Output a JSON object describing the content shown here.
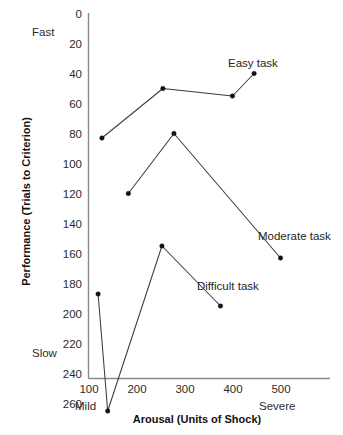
{
  "chart_data": {
    "type": "line",
    "title": "",
    "xlabel": "Arousal (Units of Shock)",
    "ylabel": "Performance (Trials to Criterion)",
    "xlim": [
      100,
      530
    ],
    "ylim": [
      0,
      275
    ],
    "y_inverted": true,
    "grid": false,
    "legend_position": "inline-end-labels",
    "x_ticks": [
      100,
      200,
      300,
      400,
      500
    ],
    "x_tick_labels": [
      "100",
      "200",
      "300",
      "400",
      "500"
    ],
    "y_ticks": [
      0,
      20,
      40,
      60,
      80,
      100,
      120,
      140,
      160,
      180,
      200,
      220,
      240,
      260
    ],
    "y_tick_labels": [
      "0",
      "20",
      "40",
      "60",
      "80",
      "100",
      "120",
      "140",
      "160",
      "180",
      "200",
      "220",
      "240",
      "260"
    ],
    "y_anchor_high_label": "Fast",
    "y_anchor_low_label": "Slow",
    "x_anchor_low_label": "Mild",
    "x_anchor_high_label": "Severe",
    "series": [
      {
        "name": "Easy task",
        "label": "Easy task",
        "x": [
          128,
          255,
          400,
          445
        ],
        "y": [
          83,
          50,
          55,
          40
        ]
      },
      {
        "name": "Moderate task",
        "label": "Moderate task",
        "x": [
          183,
          278,
          500
        ],
        "y": [
          120,
          80,
          163
        ]
      },
      {
        "name": "Difficult task",
        "label": "Difficult task",
        "x": [
          120,
          140,
          253,
          375
        ],
        "y": [
          187,
          265,
          155,
          195
        ]
      }
    ]
  },
  "labels": {
    "easy_task": "Easy task",
    "moderate_task": "Moderate task",
    "difficult_task": "Difficult task",
    "fast": "Fast",
    "slow": "Slow",
    "mild": "Mild",
    "severe": "Severe",
    "x_axis_title": "Arousal (Units of Shock)",
    "y_axis_title": "Performance (Trials to Criterion)"
  },
  "colors": {
    "line": "#3b3b3b",
    "marker": "#111111",
    "axis": "#8a8a8a",
    "text": "#2b2b2b",
    "background": "#ffffff"
  }
}
